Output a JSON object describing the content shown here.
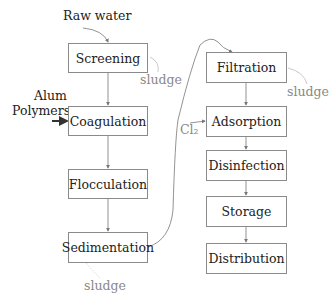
{
  "inputs": {
    "raw_water": "Raw water",
    "alum": "Alum",
    "polymers": "Polymers",
    "chlorine": "Cl₂"
  },
  "left_column": [
    {
      "label": "Screening"
    },
    {
      "label": "Coagulation"
    },
    {
      "label": "Flocculation"
    },
    {
      "label": "Sedimentation"
    }
  ],
  "right_column": [
    {
      "label": "Filtration"
    },
    {
      "label": "Adsorption"
    },
    {
      "label": "Disinfection"
    },
    {
      "label": "Storage"
    },
    {
      "label": "Distribution"
    }
  ],
  "outputs": {
    "sludge_screening": "sludge",
    "sludge_sedimentation": "sludge",
    "sludge_filtration": "sludge"
  }
}
